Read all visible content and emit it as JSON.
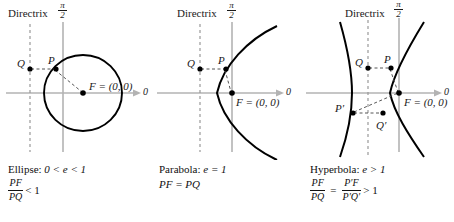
{
  "figure": {
    "axis_color": "#b3b3b3",
    "curve_color": "#000000",
    "dash_color": "#999999",
    "text_color": "#1a1a1a"
  },
  "panels": [
    {
      "id": "ellipse",
      "directrix_label": "Directrix",
      "polar_axis_label": {
        "numerator": "π",
        "denominator": "2"
      },
      "zero_label": "0",
      "focus_label": "F = (0, 0)",
      "points": [
        {
          "name": "Q",
          "label": "Q"
        },
        {
          "name": "P",
          "label": "P"
        }
      ],
      "caption": {
        "name": "Ellipse:",
        "eccentricity": "0 < e < 1",
        "ratio_top": "PF",
        "ratio_bottom": "PQ",
        "relation": "< 1"
      }
    },
    {
      "id": "parabola",
      "directrix_label": "Directrix",
      "polar_axis_label": {
        "numerator": "π",
        "denominator": "2"
      },
      "zero_label": "0",
      "focus_label": "F = (0, 0)",
      "points": [
        {
          "name": "Q",
          "label": "Q"
        },
        {
          "name": "P",
          "label": "P"
        }
      ],
      "caption": {
        "name": "Parabola:",
        "eccentricity": "e = 1",
        "equation": "PF = PQ"
      }
    },
    {
      "id": "hyperbola",
      "directrix_label": "Directrix",
      "polar_axis_label": {
        "numerator": "π",
        "denominator": "2"
      },
      "zero_label": "0",
      "focus_label": "F = (0, 0)",
      "points": [
        {
          "name": "Q",
          "label": "Q"
        },
        {
          "name": "P",
          "label": "P"
        },
        {
          "name": "P-prime",
          "label": "P′"
        },
        {
          "name": "Q-prime",
          "label": "Q′"
        }
      ],
      "caption": {
        "name": "Hyperbola:",
        "eccentricity": "e > 1",
        "ratio_top": "PF",
        "ratio_bottom": "PQ",
        "ratio2_top": "P′F",
        "ratio2_bottom": "P′Q′",
        "equals": "=",
        "relation": "> 1"
      }
    }
  ]
}
